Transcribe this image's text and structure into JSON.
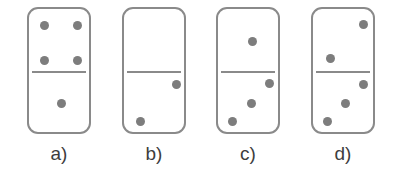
{
  "figure": {
    "background_color": "#ffffff",
    "width": 397,
    "height": 179
  },
  "style": {
    "tile_border_color": "#8a8a8a",
    "tile_fill_color": "#ffffff",
    "pip_color": "#7d7d7d",
    "divider_color": "#8a8a8a",
    "label_color": "#3d3d3d",
    "pip_diameter": 9,
    "tile_border_width": 2,
    "tile_corner_radius": 11
  },
  "options": [
    {
      "id": "a",
      "label": "a)",
      "tile": {
        "x": 27,
        "y": 7,
        "width": 64,
        "height": 127
      },
      "divider_y": 62,
      "top_value": 4,
      "bottom_value": 1,
      "label_x": 27,
      "label_width": 64,
      "label_y": 142,
      "pips": [
        {
          "half": "top",
          "cx": 15,
          "cy": 16
        },
        {
          "half": "top",
          "cx": 48,
          "cy": 16
        },
        {
          "half": "top",
          "cx": 15,
          "cy": 51
        },
        {
          "half": "top",
          "cx": 48,
          "cy": 51
        },
        {
          "half": "bottom",
          "cx": 32,
          "cy": 94
        }
      ]
    },
    {
      "id": "b",
      "label": "b)",
      "tile": {
        "x": 122,
        "y": 7,
        "width": 64,
        "height": 127
      },
      "divider_y": 62,
      "top_value": 0,
      "bottom_value": 2,
      "label_x": 122,
      "label_width": 64,
      "label_y": 142,
      "pips": [
        {
          "half": "bottom",
          "cx": 52,
          "cy": 75
        },
        {
          "half": "bottom",
          "cx": 16,
          "cy": 112
        }
      ]
    },
    {
      "id": "c",
      "label": "c)",
      "tile": {
        "x": 216,
        "y": 7,
        "width": 64,
        "height": 127
      },
      "divider_y": 62,
      "top_value": 1,
      "bottom_value": 3,
      "label_x": 216,
      "label_width": 64,
      "label_y": 142,
      "pips": [
        {
          "half": "top",
          "cx": 34,
          "cy": 32
        },
        {
          "half": "bottom",
          "cx": 51,
          "cy": 74
        },
        {
          "half": "bottom",
          "cx": 33,
          "cy": 94
        },
        {
          "half": "bottom",
          "cx": 14,
          "cy": 112
        }
      ]
    },
    {
      "id": "d",
      "label": "d)",
      "tile": {
        "x": 311,
        "y": 7,
        "width": 64,
        "height": 127
      },
      "divider_y": 62,
      "top_value": 2,
      "bottom_value": 3,
      "label_x": 311,
      "label_width": 64,
      "label_y": 142,
      "pips": [
        {
          "half": "top",
          "cx": 50,
          "cy": 15
        },
        {
          "half": "top",
          "cx": 17,
          "cy": 49
        },
        {
          "half": "bottom",
          "cx": 50,
          "cy": 75
        },
        {
          "half": "bottom",
          "cx": 32,
          "cy": 94
        },
        {
          "half": "bottom",
          "cx": 14,
          "cy": 112
        }
      ]
    }
  ]
}
